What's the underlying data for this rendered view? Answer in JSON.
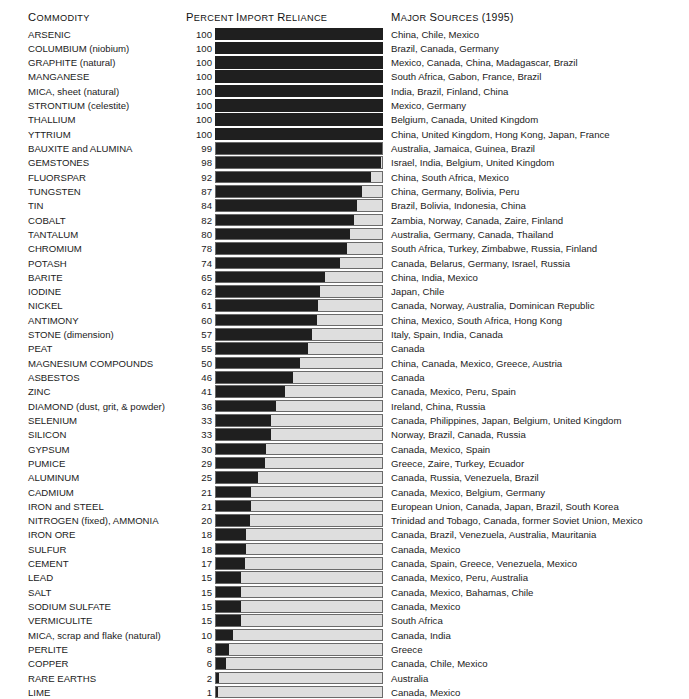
{
  "header": {
    "commodity_label": "COMMODITY",
    "percent_label": "PERCENT",
    "reliance_label": "IMPORT RELIANCE",
    "sources_label": "MAJOR SOURCES (1995)"
  },
  "caption": "",
  "colors": {
    "bar_fill": "#1f1f1f",
    "bar_track": "#dedede",
    "bar_border": "#6a6a6a",
    "text": "#1b1b1b",
    "background": "#ffffff"
  },
  "chart_data": {
    "type": "bar",
    "xlabel": "Percent Import Reliance",
    "ylabel": "Commodity",
    "xlim": [
      0,
      100
    ],
    "grid": false,
    "legend": "none",
    "orientation": "horizontal",
    "categories": [
      "ARSENIC",
      "COLUMBIUM (niobium)",
      "GRAPHITE (natural)",
      "MANGANESE",
      "MICA, sheet (natural)",
      "STRONTIUM (celestite)",
      "THALLIUM",
      "YTTRIUM",
      "BAUXITE and ALUMINA",
      "GEMSTONES",
      "FLUORSPAR",
      "TUNGSTEN",
      "TIN",
      "COBALT",
      "TANTALUM",
      "CHROMIUM",
      "POTASH",
      "BARITE",
      "IODINE",
      "NICKEL",
      "ANTIMONY",
      "STONE (dimension)",
      "PEAT",
      "MAGNESIUM COMPOUNDS",
      "ASBESTOS",
      "ZINC",
      "DIAMOND (dust, grit, & powder)",
      "SELENIUM",
      "SILICON",
      "GYPSUM",
      "PUMICE",
      "ALUMINUM",
      "CADMIUM",
      "IRON and STEEL",
      "NITROGEN (fixed), AMMONIA",
      "IRON ORE",
      "SULFUR",
      "CEMENT",
      "LEAD",
      "SALT",
      "SODIUM SULFATE",
      "VERMICULITE",
      "MICA, scrap and flake (natural)",
      "PERLITE",
      "COPPER",
      "RARE EARTHS",
      "LIME"
    ],
    "values": [
      100,
      100,
      100,
      100,
      100,
      100,
      100,
      100,
      99,
      98,
      92,
      87,
      84,
      82,
      80,
      78,
      74,
      65,
      62,
      61,
      60,
      57,
      55,
      50,
      46,
      41,
      36,
      33,
      33,
      30,
      29,
      25,
      21,
      21,
      20,
      18,
      18,
      17,
      15,
      15,
      15,
      15,
      10,
      8,
      6,
      2,
      1
    ]
  },
  "rows": [
    {
      "commodity": "ARSENIC",
      "percent": "100",
      "value": 100,
      "sources": "China, Chile, Mexico"
    },
    {
      "commodity": "COLUMBIUM (niobium)",
      "percent": "100",
      "value": 100,
      "sources": "Brazil, Canada, Germany"
    },
    {
      "commodity": "GRAPHITE (natural)",
      "percent": "100",
      "value": 100,
      "sources": "Mexico, Canada, China, Madagascar, Brazil"
    },
    {
      "commodity": "MANGANESE",
      "percent": "100",
      "value": 100,
      "sources": "South Africa, Gabon, France, Brazil"
    },
    {
      "commodity": "MICA, sheet (natural)",
      "percent": "100",
      "value": 100,
      "sources": "India, Brazil, Finland, China"
    },
    {
      "commodity": "STRONTIUM (celestite)",
      "percent": "100",
      "value": 100,
      "sources": "Mexico, Germany"
    },
    {
      "commodity": "THALLIUM",
      "percent": "100",
      "value": 100,
      "sources": "Belgium, Canada, United Kingdom"
    },
    {
      "commodity": "YTTRIUM",
      "percent": "100",
      "value": 100,
      "sources": "China, United Kingdom, Hong Kong, Japan, France"
    },
    {
      "commodity": "BAUXITE and ALUMINA",
      "percent": "99",
      "value": 99,
      "sources": "Australia, Jamaica, Guinea, Brazil"
    },
    {
      "commodity": "GEMSTONES",
      "percent": "98",
      "value": 98,
      "sources": "Israel, India, Belgium, United Kingdom"
    },
    {
      "commodity": "FLUORSPAR",
      "percent": "92",
      "value": 92,
      "sources": "China, South Africa, Mexico"
    },
    {
      "commodity": "TUNGSTEN",
      "percent": "87",
      "value": 87,
      "sources": "China, Germany, Bolivia, Peru"
    },
    {
      "commodity": "TIN",
      "percent": "84",
      "value": 84,
      "sources": "Brazil, Bolivia, Indonesia, China"
    },
    {
      "commodity": "COBALT",
      "percent": "82",
      "value": 82,
      "sources": "Zambia, Norway, Canada, Zaire, Finland"
    },
    {
      "commodity": "TANTALUM",
      "percent": "80",
      "value": 80,
      "sources": "Australia, Germany, Canada, Thailand"
    },
    {
      "commodity": "CHROMIUM",
      "percent": "78",
      "value": 78,
      "sources": "South Africa, Turkey, Zimbabwe, Russia, Finland"
    },
    {
      "commodity": "POTASH",
      "percent": "74",
      "value": 74,
      "sources": "Canada, Belarus, Germany, Israel, Russia"
    },
    {
      "commodity": "BARITE",
      "percent": "65",
      "value": 65,
      "sources": "China, India, Mexico"
    },
    {
      "commodity": "IODINE",
      "percent": "62",
      "value": 62,
      "sources": "Japan, Chile"
    },
    {
      "commodity": "NICKEL",
      "percent": "61",
      "value": 61,
      "sources": "Canada, Norway, Australia, Dominican Republic"
    },
    {
      "commodity": "ANTIMONY",
      "percent": "60",
      "value": 60,
      "sources": "China, Mexico, South Africa, Hong Kong"
    },
    {
      "commodity": "STONE (dimension)",
      "percent": "57",
      "value": 57,
      "sources": "Italy, Spain, India, Canada"
    },
    {
      "commodity": "PEAT",
      "percent": "55",
      "value": 55,
      "sources": "Canada"
    },
    {
      "commodity": "MAGNESIUM COMPOUNDS",
      "percent": "50",
      "value": 50,
      "sources": "China, Canada, Mexico, Greece, Austria"
    },
    {
      "commodity": "ASBESTOS",
      "percent": "46",
      "value": 46,
      "sources": "Canada"
    },
    {
      "commodity": "ZINC",
      "percent": "41",
      "value": 41,
      "sources": "Canada, Mexico, Peru, Spain"
    },
    {
      "commodity": "DIAMOND (dust, grit, & powder)",
      "percent": "36",
      "value": 36,
      "sources": "Ireland, China, Russia"
    },
    {
      "commodity": "SELENIUM",
      "percent": "33",
      "value": 33,
      "sources": "Canada, Philippines, Japan, Belgium, United Kingdom"
    },
    {
      "commodity": "SILICON",
      "percent": "33",
      "value": 33,
      "sources": "Norway, Brazil, Canada, Russia"
    },
    {
      "commodity": "GYPSUM",
      "percent": "30",
      "value": 30,
      "sources": "Canada, Mexico, Spain"
    },
    {
      "commodity": "PUMICE",
      "percent": "29",
      "value": 29,
      "sources": "Greece, Zaire, Turkey, Ecuador"
    },
    {
      "commodity": "ALUMINUM",
      "percent": "25",
      "value": 25,
      "sources": "Canada, Russia, Venezuela, Brazil"
    },
    {
      "commodity": "CADMIUM",
      "percent": "21",
      "value": 21,
      "sources": "Canada, Mexico, Belgium, Germany"
    },
    {
      "commodity": "IRON and STEEL",
      "percent": "21",
      "value": 21,
      "sources": "European Union, Canada, Japan, Brazil, South Korea"
    },
    {
      "commodity": "NITROGEN (fixed), AMMONIA",
      "percent": "20",
      "value": 20,
      "sources": "Trinidad and Tobago, Canada, former Soviet Union, Mexico"
    },
    {
      "commodity": "IRON ORE",
      "percent": "18",
      "value": 18,
      "sources": "Canada, Brazil, Venezuela, Australia, Mauritania"
    },
    {
      "commodity": "SULFUR",
      "percent": "18",
      "value": 18,
      "sources": "Canada, Mexico"
    },
    {
      "commodity": "CEMENT",
      "percent": "17",
      "value": 17,
      "sources": "Canada, Spain, Greece, Venezuela, Mexico"
    },
    {
      "commodity": "LEAD",
      "percent": "15",
      "value": 15,
      "sources": "Canada, Mexico, Peru, Australia"
    },
    {
      "commodity": "SALT",
      "percent": "15",
      "value": 15,
      "sources": "Canada, Mexico, Bahamas, Chile"
    },
    {
      "commodity": "SODIUM SULFATE",
      "percent": "15",
      "value": 15,
      "sources": "Canada, Mexico"
    },
    {
      "commodity": "VERMICULITE",
      "percent": "15",
      "value": 15,
      "sources": "South Africa"
    },
    {
      "commodity": "MICA, scrap and flake (natural)",
      "percent": "10",
      "value": 10,
      "sources": "Canada, India"
    },
    {
      "commodity": "PERLITE",
      "percent": "8",
      "value": 8,
      "sources": "Greece"
    },
    {
      "commodity": "COPPER",
      "percent": "6",
      "value": 6,
      "sources": "Canada, Chile, Mexico"
    },
    {
      "commodity": "RARE EARTHS",
      "percent": "2",
      "value": 2,
      "sources": "Australia"
    },
    {
      "commodity": "LIME",
      "percent": "1",
      "value": 1,
      "sources": "Canada, Mexico"
    }
  ]
}
